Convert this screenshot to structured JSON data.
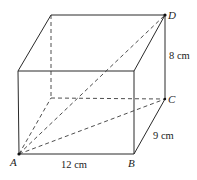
{
  "figure": {
    "type": "rectangular prism (cuboid) with space diagonal",
    "vertices": {
      "A": {
        "label": "A"
      },
      "B": {
        "label": "B"
      },
      "C": {
        "label": "C"
      },
      "D": {
        "label": "D"
      }
    },
    "dimensions": {
      "length": "12 cm",
      "width": "9 cm",
      "height": "8 cm"
    }
  }
}
